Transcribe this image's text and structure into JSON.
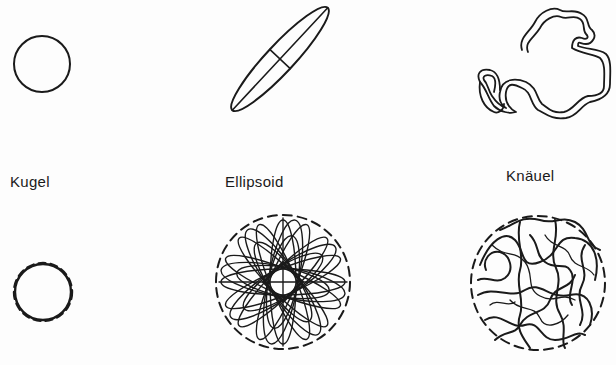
{
  "figure": {
    "columns": [
      {
        "id": "sphere",
        "label": "Kugel"
      },
      {
        "id": "ellipsoid",
        "label": "Ellipsoid"
      },
      {
        "id": "coil",
        "label": "Knäuel"
      }
    ]
  },
  "colors": {
    "ink": "#1a1a1a",
    "background": "#fdfdfd"
  }
}
